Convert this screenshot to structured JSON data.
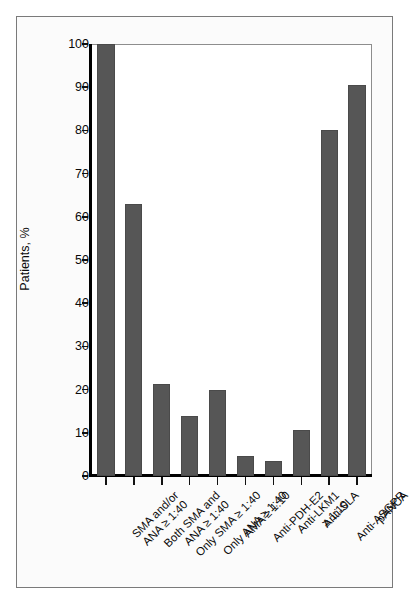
{
  "chart_data": {
    "type": "bar",
    "title": "",
    "subtitle": "",
    "xlabel": "",
    "ylabel": "Patients, %",
    "ylim": [
      0,
      100
    ],
    "yticks": [
      0,
      10,
      20,
      30,
      40,
      50,
      60,
      70,
      80,
      90,
      100
    ],
    "grid": false,
    "legend": null,
    "orientation": "vertical",
    "bar_color": "#565656",
    "background_color": "#ffffff",
    "categories": [
      "SMA and/or ANA ≥ 1:40",
      "Both SMA and ANA ≥ 1:40",
      "Only SMA ≥ 1:40",
      "Only ANA ≥ 1:40",
      "AMA ≥ 1:10",
      "Anti-PDH-E2",
      "Anti-LKM1 ≥ 1:10",
      "Anti-SLA",
      "Anti-ASGPR",
      "pANCA"
    ],
    "category_lines": [
      [
        "SMA and/or",
        "ANA ≥ 1:40"
      ],
      [
        "Both SMA and",
        "ANA ≥ 1:40"
      ],
      [
        "Only SMA ≥ 1:40",
        ""
      ],
      [
        "Only ANA ≥ 1:40",
        ""
      ],
      [
        "AMA ≥ 1:10",
        ""
      ],
      [
        "Anti-PDH-E2",
        ""
      ],
      [
        "Anti-LKM1",
        "≥ 1:10"
      ],
      [
        "Anti-SLA",
        ""
      ],
      [
        "Anti-ASGPR",
        ""
      ],
      [
        "pANCA",
        ""
      ]
    ],
    "values": [
      100,
      63,
      21.4,
      14,
      20,
      4.7,
      3.5,
      10.6,
      80,
      90.5
    ]
  }
}
